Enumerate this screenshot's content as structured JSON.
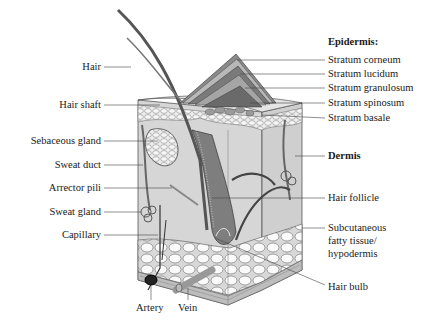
{
  "diagram": {
    "type": "anatomical cross-section",
    "epidermis_heading": "Epidermis:",
    "epidermis_layers": [
      "Stratum corneum",
      "Stratum lucidum",
      "Stratum granulosum",
      "Stratum spinosum",
      "Stratum basale"
    ],
    "left_labels": [
      "Hair",
      "Hair shaft",
      "Sebaceous gland",
      "Sweat duct",
      "Arrector pili",
      "Sweat gland",
      "Capillary"
    ],
    "right_labels": {
      "dermis": "Dermis",
      "hair_follicle": "Hair follicle",
      "subcutaneous_line1": "Subcutaneous",
      "subcutaneous_line2": "fatty tissue/",
      "subcutaneous_line3": "hypodermis",
      "hair_bulb": "Hair bulb"
    },
    "bottom_labels": {
      "artery": "Artery",
      "vein": "Vein"
    }
  }
}
